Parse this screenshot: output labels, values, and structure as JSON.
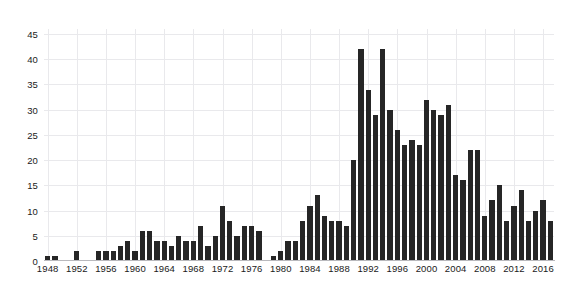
{
  "chart_data": {
    "type": "bar",
    "title": "",
    "subtitle": "",
    "xlabel": "",
    "ylabel": "",
    "xlim": [
      1947.5,
      2017.5
    ],
    "ylim": [
      0,
      46
    ],
    "grid": true,
    "legend": null,
    "y_ticks": [
      0,
      5,
      10,
      15,
      20,
      25,
      30,
      35,
      40,
      45
    ],
    "x_ticks": [
      1948,
      1952,
      1956,
      1960,
      1964,
      1968,
      1972,
      1976,
      1980,
      1984,
      1988,
      1992,
      1996,
      2000,
      2004,
      2008,
      2012,
      2016
    ],
    "bar_color": "#262626",
    "categories": [
      1948,
      1949,
      1950,
      1951,
      1952,
      1953,
      1954,
      1955,
      1956,
      1957,
      1958,
      1959,
      1960,
      1961,
      1962,
      1963,
      1964,
      1965,
      1966,
      1967,
      1968,
      1969,
      1970,
      1971,
      1972,
      1973,
      1974,
      1975,
      1976,
      1977,
      1978,
      1979,
      1980,
      1981,
      1982,
      1983,
      1984,
      1985,
      1986,
      1987,
      1988,
      1989,
      1990,
      1991,
      1992,
      1993,
      1994,
      1995,
      1996,
      1997,
      1998,
      1999,
      2000,
      2001,
      2002,
      2003,
      2004,
      2005,
      2006,
      2007,
      2008,
      2009,
      2010,
      2011,
      2012,
      2013,
      2014,
      2015,
      2016,
      2017
    ],
    "values": [
      1,
      1,
      0,
      0,
      2,
      0,
      0,
      2,
      2,
      2,
      3,
      4,
      2,
      6,
      6,
      4,
      4,
      3,
      5,
      4,
      4,
      7,
      3,
      5,
      11,
      8,
      5,
      7,
      7,
      6,
      0,
      1,
      2,
      4,
      4,
      8,
      11,
      13,
      9,
      8,
      8,
      7,
      20,
      42,
      34,
      29,
      42,
      30,
      26,
      23,
      24,
      23,
      32,
      30,
      29,
      31,
      17,
      16,
      22,
      22,
      9,
      12,
      15,
      8,
      11,
      14,
      8,
      10,
      12,
      8
    ]
  }
}
